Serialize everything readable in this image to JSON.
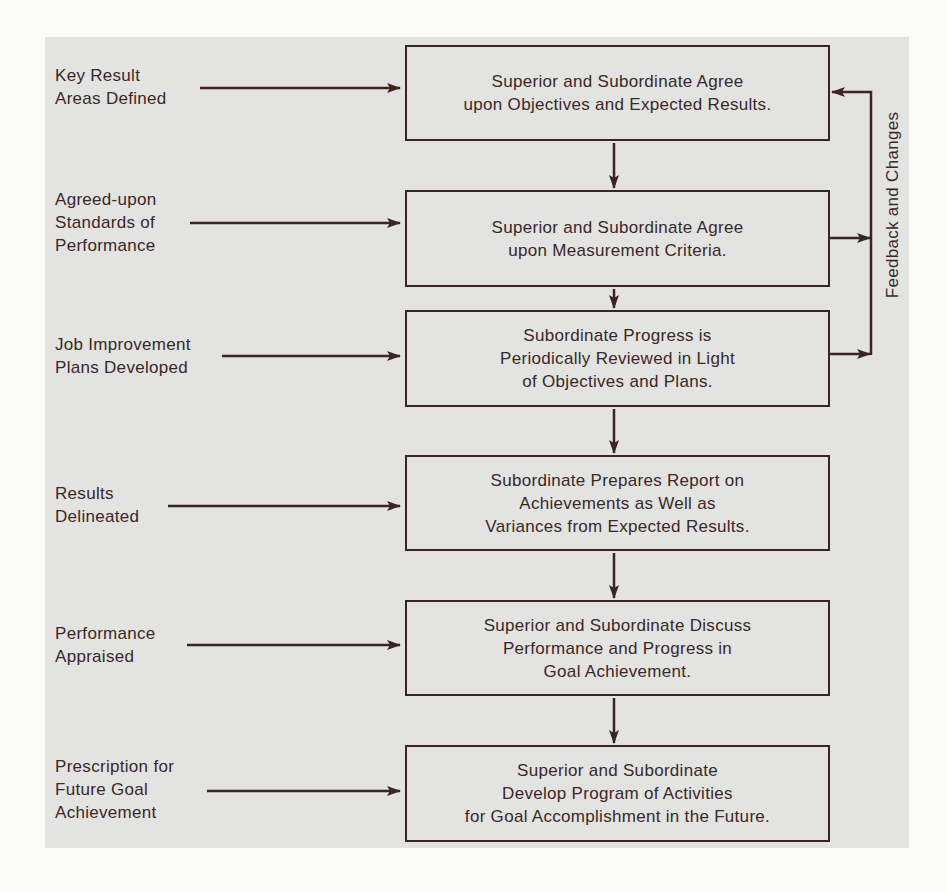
{
  "diagram": {
    "type": "flowchart",
    "colors": {
      "background": "#e3e3e1",
      "line": "#3a2424",
      "text": "#3a2828"
    },
    "steps": [
      {
        "id": "step-1",
        "text": "Superior and Subordinate Agree\nupon Objectives and Expected Results."
      },
      {
        "id": "step-2",
        "text": "Superior and Subordinate Agree\nupon Measurement Criteria."
      },
      {
        "id": "step-3",
        "text": "Subordinate Progress is\nPeriodically Reviewed in Light\nof Objectives and Plans."
      },
      {
        "id": "step-4",
        "text": "Subordinate Prepares Report on\nAchievements as Well as\nVariances from Expected Results."
      },
      {
        "id": "step-5",
        "text": "Superior and Subordinate Discuss\nPerformance and Progress in\nGoal Achievement."
      },
      {
        "id": "step-6",
        "text": "Superior and Subordinate\nDevelop Program of Activities\nfor Goal Accomplishment in the Future."
      }
    ],
    "inputs": [
      {
        "target": "step-1",
        "text": "Key Result\nAreas Defined"
      },
      {
        "target": "step-2",
        "text": "Agreed-upon\nStandards of\nPerformance"
      },
      {
        "target": "step-3",
        "text": "Job Improvement\nPlans Developed"
      },
      {
        "target": "step-4",
        "text": "Results\nDelineated"
      },
      {
        "target": "step-5",
        "text": "Performance\nAppraised"
      },
      {
        "target": "step-6",
        "text": "Prescription for\nFuture Goal\nAchievement"
      }
    ],
    "feedback": {
      "label": "Feedback and Changes",
      "from": [
        "step-2",
        "step-3"
      ],
      "to": "step-1"
    }
  }
}
